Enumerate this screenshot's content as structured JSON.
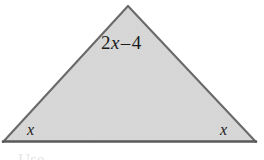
{
  "figure": {
    "canvas": {
      "width": 264,
      "height": 160,
      "background_color": "#ffffff"
    },
    "shape": {
      "kind": "triangle",
      "fill_color": "#dcdcdc",
      "stroke_color": "#6a6a6a",
      "base_stroke_color": "#5a5a5a",
      "stroke_width": 2,
      "vertices": {
        "apex": [
          128,
          6
        ],
        "bottom_left": [
          3,
          142
        ],
        "bottom_right": [
          256,
          142
        ]
      }
    },
    "labels": {
      "top_side": {
        "full": "2x – 4",
        "coefficient": "2",
        "variable": "x",
        "operator": "–",
        "constant": "4"
      },
      "bottom_left_angle": "x",
      "bottom_right_angle": "x"
    },
    "caption_fragment": "Use",
    "text_color": "#1b1b1b"
  }
}
